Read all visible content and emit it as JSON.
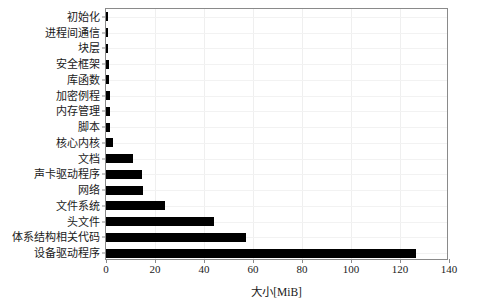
{
  "chart_data": {
    "type": "bar",
    "orientation": "horizontal",
    "title": "",
    "xlabel": "大小[MiB]",
    "ylabel": "",
    "xlim": [
      0,
      140
    ],
    "xticks": [
      0,
      20,
      40,
      60,
      80,
      100,
      120,
      140
    ],
    "xticklabels": [
      "0",
      "20",
      "40",
      "60",
      "80",
      "100",
      "120",
      "140"
    ],
    "grid": true,
    "legend": null,
    "categories": [
      "初始化",
      "进程间通信",
      "块层",
      "安全框架",
      "库函数",
      "加密例程",
      "内存管理",
      "脚本",
      "核心内核",
      "文档",
      "声卡驱动程序",
      "网络",
      "文件系统",
      "头文件",
      "体系结构相关代码",
      "设备驱动程序"
    ],
    "values": [
      0.4,
      0.5,
      0.8,
      1.3,
      1.4,
      1.5,
      1.6,
      1.7,
      3.0,
      11.0,
      14.5,
      15.0,
      24.0,
      44.0,
      57.0,
      126.5
    ],
    "bar_color": "#000000"
  }
}
